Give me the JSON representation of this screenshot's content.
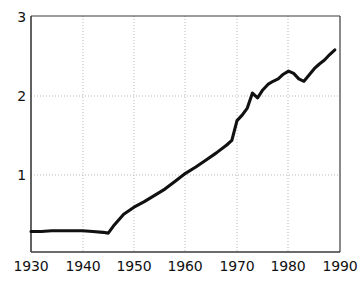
{
  "chart_data": {
    "type": "line",
    "title": "",
    "subtitle": "",
    "xlabel": "",
    "ylabel": "",
    "xlim": [
      1930,
      1990
    ],
    "ylim": [
      0,
      3
    ],
    "xticks": [
      1930,
      1940,
      1950,
      1960,
      1970,
      1980,
      1990
    ],
    "yticks": [
      1,
      2,
      3
    ],
    "xtick_labels": [
      "1930",
      "1940",
      "1950",
      "1960",
      "1970",
      "1980",
      "1990"
    ],
    "ytick_labels": [
      "1",
      "2",
      "3"
    ],
    "grid": "dotted-both",
    "legend": "none",
    "line_color": "#111111",
    "grid_color": "#b9b9b9",
    "axis_color": "#3a3a3a",
    "series": [
      {
        "name": "value",
        "x": [
          1930,
          1932,
          1934,
          1936,
          1938,
          1940,
          1942,
          1944,
          1945,
          1946,
          1948,
          1950,
          1952,
          1954,
          1956,
          1958,
          1960,
          1962,
          1964,
          1966,
          1968,
          1969,
          1970,
          1971,
          1972,
          1973,
          1974,
          1975,
          1976,
          1977,
          1978,
          1979,
          1980,
          1981,
          1982,
          1983,
          1984,
          1985,
          1986,
          1987,
          1988,
          1989
        ],
        "y": [
          0.26,
          0.26,
          0.27,
          0.27,
          0.27,
          0.27,
          0.26,
          0.25,
          0.24,
          0.33,
          0.48,
          0.57,
          0.64,
          0.72,
          0.8,
          0.9,
          1.0,
          1.08,
          1.17,
          1.26,
          1.36,
          1.42,
          1.67,
          1.74,
          1.83,
          2.02,
          1.96,
          2.06,
          2.13,
          2.17,
          2.2,
          2.26,
          2.3,
          2.27,
          2.2,
          2.17,
          2.25,
          2.33,
          2.39,
          2.44,
          2.51,
          2.57
        ]
      }
    ]
  },
  "axes": {
    "y_axis_name": "value-axis",
    "x_axis_name": "year-axis"
  }
}
